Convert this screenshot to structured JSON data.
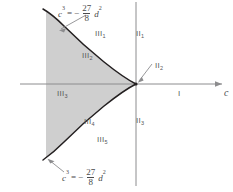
{
  "figure": {
    "title": "",
    "axes": {
      "horizontal_label": "c",
      "vertical_label": "",
      "origin": {
        "x": 136,
        "y": 84
      }
    },
    "colors": {
      "shaded_region": "#cfcfcf",
      "curve": "#231f20",
      "axis": "#8c8c8e",
      "label_text": "#58585a",
      "background": "#ffffff"
    },
    "equations": {
      "top": {
        "lhs": "c",
        "lhs_exp": "3",
        "relation": "=",
        "sign": "−",
        "numerator": "27",
        "denominator": "8",
        "rhs_var": "d",
        "rhs_exp": "2",
        "full": "c³ = − 27/8 d²"
      },
      "bottom": {
        "lhs": "c",
        "lhs_exp": "3",
        "relation": "=",
        "sign": "−",
        "numerator": "27",
        "denominator": "8",
        "rhs_var": "d",
        "rhs_exp": "2",
        "full": "c³ = − 27/8 d²"
      }
    },
    "region_labels": [
      {
        "name": "region-I",
        "base": "I",
        "sub": "",
        "x": 178,
        "y": 90
      },
      {
        "name": "region-II-1",
        "base": "II",
        "sub": "1",
        "x": 136,
        "y": 30
      },
      {
        "name": "region-II-2",
        "base": "II",
        "sub": "2",
        "x": 155,
        "y": 62
      },
      {
        "name": "region-II-3",
        "base": "II",
        "sub": "3",
        "x": 136,
        "y": 117
      },
      {
        "name": "region-III-1",
        "base": "III",
        "sub": "1",
        "x": 95,
        "y": 30
      },
      {
        "name": "region-III-2",
        "base": "III",
        "sub": "2",
        "x": 82,
        "y": 52
      },
      {
        "name": "region-III-3",
        "base": "III",
        "sub": "3",
        "x": 57,
        "y": 90
      },
      {
        "name": "region-III-4",
        "base": "III",
        "sub": "4",
        "x": 84,
        "y": 118
      },
      {
        "name": "region-III-5",
        "base": "III",
        "sub": "5",
        "x": 97,
        "y": 136
      }
    ]
  }
}
